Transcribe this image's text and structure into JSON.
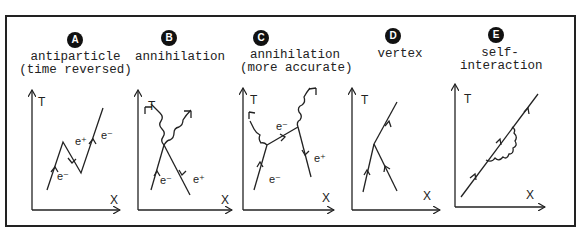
{
  "figure": {
    "axis_time_label": "T",
    "axis_space_label": "X",
    "panels": [
      {
        "badge": "A",
        "title_line1": "antiparticle",
        "title_line2": "(time reversed)",
        "labels": [
          "e⁻",
          "e⁺",
          "e⁻"
        ]
      },
      {
        "badge": "B",
        "title_line1": "annihilation",
        "title_line2": "",
        "labels": [
          "e⁻",
          "e⁺"
        ]
      },
      {
        "badge": "C",
        "title_line1": "annihilation",
        "title_line2": "(more accurate)",
        "labels": [
          "e⁻",
          "e⁻",
          "e⁺"
        ]
      },
      {
        "badge": "D",
        "title_line1": "vertex",
        "title_line2": "",
        "labels": []
      },
      {
        "badge": "E",
        "title_line1": "self-",
        "title_line2": "interaction",
        "labels": []
      }
    ]
  }
}
